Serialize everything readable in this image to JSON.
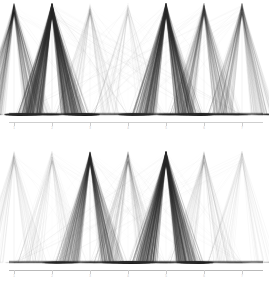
{
  "figure": {
    "background_color": "#ffffff",
    "ink_color": "#2b2b2b",
    "axis_color": "#cfcfcf",
    "tick_label_color": "#c8c8c8"
  },
  "chart_data": [
    {
      "type": "line",
      "subtype": "parallel-coordinates",
      "panel": "top",
      "title": "",
      "subtitle": "",
      "xlabel": "",
      "ylabel": "",
      "grid": false,
      "legend": false,
      "axis_count": 7,
      "categories": [
        "1",
        "2",
        "3",
        "4",
        "5",
        "6",
        "7"
      ],
      "tick_labels": [
        "1",
        "2",
        "3",
        "4",
        "5",
        "6",
        "7"
      ],
      "tick_positions_px": [
        14,
        52,
        90,
        128,
        166,
        204,
        242
      ],
      "ylim": [
        0,
        1
      ],
      "xlim": [
        0,
        8
      ],
      "axis_density": [
        0.45,
        0.92,
        0.14,
        0.1,
        0.8,
        0.4,
        0.34
      ],
      "series": [
        {
          "name": "axis-1-bundle",
          "peak_x": 14,
          "opacity": 0.45,
          "values": [
            1,
            0,
            0,
            0,
            0,
            0,
            0
          ]
        },
        {
          "name": "axis-2-bundle",
          "peak_x": 52,
          "opacity": 0.92,
          "values": [
            0,
            1,
            0,
            0,
            0,
            0,
            0
          ]
        },
        {
          "name": "axis-3-bundle",
          "peak_x": 90,
          "opacity": 0.14,
          "values": [
            0,
            0,
            1,
            0,
            0,
            0,
            0
          ]
        },
        {
          "name": "axis-4-bundle",
          "peak_x": 128,
          "opacity": 0.1,
          "values": [
            0,
            0,
            0,
            1,
            0,
            0,
            0
          ]
        },
        {
          "name": "axis-5-bundle",
          "peak_x": 166,
          "opacity": 0.8,
          "values": [
            0,
            0,
            0,
            0,
            1,
            0,
            0
          ]
        },
        {
          "name": "axis-6-bundle",
          "peak_x": 204,
          "opacity": 0.4,
          "values": [
            0,
            0,
            0,
            0,
            0,
            1,
            0
          ]
        },
        {
          "name": "axis-7-bundle",
          "peak_x": 242,
          "opacity": 0.34,
          "values": [
            0,
            0,
            0,
            0,
            0,
            0,
            1
          ]
        }
      ]
    },
    {
      "type": "line",
      "subtype": "parallel-coordinates",
      "panel": "bottom",
      "title": "",
      "subtitle": "",
      "xlabel": "",
      "ylabel": "",
      "grid": false,
      "legend": false,
      "axis_count": 7,
      "categories": [
        "1",
        "2",
        "3",
        "4",
        "5",
        "6",
        "7"
      ],
      "tick_labels": [
        "1",
        "2",
        "3",
        "4",
        "5",
        "6",
        "7"
      ],
      "tick_positions_px": [
        14,
        52,
        90,
        128,
        166,
        204,
        242
      ],
      "ylim": [
        0,
        1
      ],
      "xlim": [
        0,
        8
      ],
      "axis_density": [
        0.12,
        0.12,
        0.62,
        0.22,
        0.88,
        0.16,
        0.1
      ],
      "series": [
        {
          "name": "axis-1-bundle",
          "peak_x": 14,
          "opacity": 0.12,
          "values": [
            1,
            0,
            0,
            0,
            0,
            0,
            0
          ]
        },
        {
          "name": "axis-2-bundle",
          "peak_x": 52,
          "opacity": 0.12,
          "values": [
            0,
            1,
            0,
            0,
            0,
            0,
            0
          ]
        },
        {
          "name": "axis-3-bundle",
          "peak_x": 90,
          "opacity": 0.62,
          "values": [
            0,
            0,
            1,
            0,
            0,
            0,
            0
          ]
        },
        {
          "name": "axis-4-bundle",
          "peak_x": 128,
          "opacity": 0.22,
          "values": [
            0,
            0,
            0,
            1,
            0,
            0,
            0
          ]
        },
        {
          "name": "axis-5-bundle",
          "peak_x": 166,
          "opacity": 0.88,
          "values": [
            0,
            0,
            0,
            0,
            1,
            0,
            0
          ]
        },
        {
          "name": "axis-6-bundle",
          "peak_x": 204,
          "opacity": 0.16,
          "values": [
            0,
            0,
            0,
            0,
            0,
            1,
            0
          ]
        },
        {
          "name": "axis-7-bundle",
          "peak_x": 242,
          "opacity": 0.1,
          "values": [
            0,
            0,
            0,
            0,
            0,
            0,
            1
          ]
        }
      ]
    }
  ]
}
